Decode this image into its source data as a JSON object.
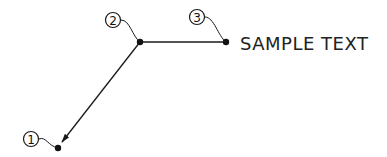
{
  "diagram": {
    "type": "multileader-callout",
    "text": "SAMPLE TEXT",
    "points": [
      {
        "id": "1",
        "label": "1",
        "x": 58,
        "y": 148,
        "role": "arrowhead-point"
      },
      {
        "id": "2",
        "label": "2",
        "x": 140,
        "y": 42,
        "role": "vertex-point"
      },
      {
        "id": "3",
        "label": "3",
        "x": 226,
        "y": 42,
        "role": "text-attach-point"
      }
    ],
    "markers": [
      {
        "label": "1",
        "cx": 31,
        "cy": 139
      },
      {
        "label": "2",
        "cx": 113,
        "cy": 20
      },
      {
        "label": "3",
        "cx": 197,
        "cy": 17
      }
    ],
    "colors": {
      "line": "#1a1a1a",
      "background": "#ffffff"
    }
  }
}
